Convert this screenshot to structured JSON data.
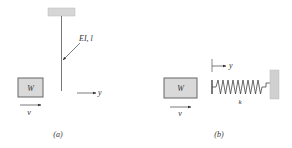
{
  "figure_a": {
    "caption": "(a)",
    "beam_label": "EI, l",
    "mass_label": "W",
    "velocity_label": "v",
    "displacement_label": "y"
  },
  "figure_b": {
    "caption": "(b)",
    "spring_label": "k",
    "mass_label": "W",
    "velocity_label": "v",
    "displacement_label": "y"
  },
  "colors": {
    "fill_gray": "#d9d9d9",
    "stroke": "#555555",
    "line": "#666666"
  }
}
